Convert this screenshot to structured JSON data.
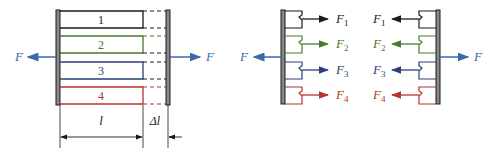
{
  "colors": {
    "black": "#1a1a1a",
    "green": "#4a7a2a",
    "blue": "#2a3f7a",
    "red": "#b8332a",
    "force": "#3a6aa8"
  },
  "left_diagram": {
    "force_left_label": "F",
    "force_right_label": "F",
    "bars": [
      {
        "label": "1",
        "color": "black"
      },
      {
        "label": "2",
        "color": "green"
      },
      {
        "label": "3",
        "color": "blue"
      },
      {
        "label": "4",
        "color": "red"
      }
    ],
    "length_label": "l",
    "elongation_label": "Δl"
  },
  "right_diagram": {
    "left_part": {
      "force_label": "F",
      "bar_forces": [
        {
          "label": "F",
          "sub": "1",
          "color": "black"
        },
        {
          "label": "F",
          "sub": "2",
          "color": "green"
        },
        {
          "label": "F",
          "sub": "3",
          "color": "blue"
        },
        {
          "label": "F",
          "sub": "4",
          "color": "red"
        }
      ]
    },
    "right_part": {
      "force_label": "F",
      "bar_forces": [
        {
          "label": "F",
          "sub": "1",
          "color": "black"
        },
        {
          "label": "F",
          "sub": "2",
          "color": "green"
        },
        {
          "label": "F",
          "sub": "3",
          "color": "blue"
        },
        {
          "label": "F",
          "sub": "4",
          "color": "red"
        }
      ]
    }
  }
}
